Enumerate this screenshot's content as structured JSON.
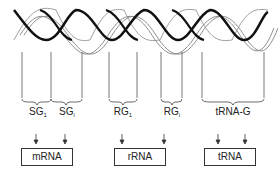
{
  "diagram": {
    "title": "",
    "genes": [
      {
        "label": "SG",
        "sub": "1"
      },
      {
        "label": "SG",
        "sub": "i"
      },
      {
        "label": "RG",
        "sub": "1"
      },
      {
        "label": "RG",
        "sub": "i"
      },
      {
        "label": "tRNA-G",
        "sub": ""
      }
    ],
    "products": [
      {
        "label": "mRNA"
      },
      {
        "label": "rRNA"
      },
      {
        "label": "tRNA"
      }
    ],
    "colors": {
      "stroke": "#222222",
      "helix_dark": "#111111",
      "helix_light": "#777777"
    }
  }
}
